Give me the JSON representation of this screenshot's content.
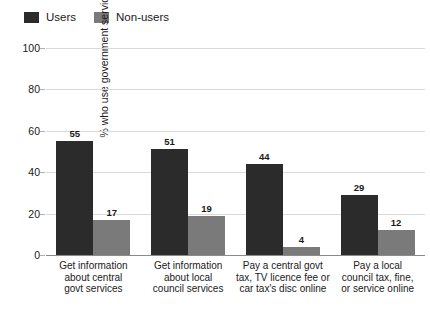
{
  "chart_data": {
    "type": "bar",
    "title": "",
    "xlabel": "",
    "ylabel": "% who use government services",
    "ylim": [
      0,
      100
    ],
    "yticks": [
      0,
      20,
      40,
      60,
      80,
      100
    ],
    "grid": true,
    "legend_position": "top-left",
    "categories": [
      "Get information about central govt services",
      "Get information about local council services",
      "Pay a central govt tax, TV licence fee or car tax's disc online",
      "Pay a local council tax, fine, or service online"
    ],
    "category_lines": [
      [
        "Get information",
        "about central",
        "govt services"
      ],
      [
        "Get information",
        "about local",
        "council services"
      ],
      [
        "Pay a central govt",
        "tax, TV licence fee or",
        "car tax's disc online"
      ],
      [
        "Pay a local",
        "council tax, fine,",
        "or service online"
      ]
    ],
    "series": [
      {
        "name": "Users",
        "color": "#2b2b2b",
        "values": [
          55,
          51,
          44,
          29
        ]
      },
      {
        "name": "Non-users",
        "color": "#7a7a7a",
        "values": [
          17,
          19,
          4,
          12
        ]
      }
    ]
  },
  "legend": {
    "items": [
      {
        "label": "Users",
        "color": "#2b2b2b"
      },
      {
        "label": "Non-users",
        "color": "#7a7a7a"
      }
    ]
  },
  "axis": {
    "y_title": "% who use government services",
    "y_tick_labels": [
      "100",
      "80",
      "60",
      "40",
      "20",
      "0"
    ]
  }
}
